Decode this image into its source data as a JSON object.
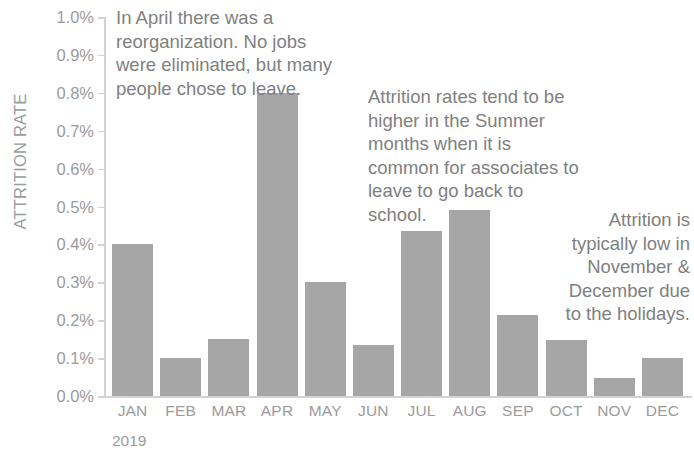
{
  "chart_data": {
    "type": "bar",
    "title": "",
    "xlabel": "2019",
    "ylabel": "ATTRITION RATE",
    "categories": [
      "JAN",
      "FEB",
      "MAR",
      "APR",
      "MAY",
      "JUN",
      "JUL",
      "AUG",
      "SEP",
      "OCT",
      "NOV",
      "DEC"
    ],
    "values": [
      0.4,
      0.1,
      0.15,
      0.8,
      0.3,
      0.135,
      0.435,
      0.49,
      0.215,
      0.147,
      0.047,
      0.1
    ],
    "value_unit": "%",
    "ylim": [
      0.0,
      1.0
    ],
    "ytick_labels": [
      "1.0%",
      "0.9%",
      "0.8%",
      "0.7%",
      "0.6%",
      "0.5%",
      "0.4%",
      "0.3%",
      "0.2%",
      "0.1%",
      "0.0%"
    ],
    "ytick_values": [
      1.0,
      0.9,
      0.8,
      0.7,
      0.6,
      0.5,
      0.4,
      0.3,
      0.2,
      0.1,
      0.0
    ],
    "grid": false,
    "legend": "none",
    "bar_color": "#a6a6a6",
    "axis_color": "#d3d3d3",
    "label_color": "#9b9b9b",
    "annotation_color": "#808080",
    "annotations": [
      "In April there was a\nreorganization. No jobs\nwere eliminated, but many\npeople chose to leave.",
      "Attrition rates tend to be\nhigher in the Summer\nmonths when it is\ncommon for associates to\nleave to go back to\nschool.",
      "Attrition is\ntypically low in\nNovember &\nDecember due\nto the holidays."
    ]
  },
  "axis": {
    "y_title": "ATTRITION RATE",
    "x_group_label": "2019"
  },
  "title_fragment": ""
}
